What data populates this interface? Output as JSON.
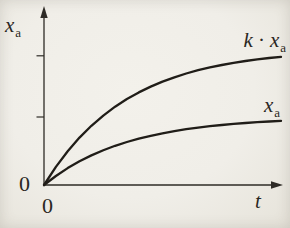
{
  "colors": {
    "background": "#f0eee8",
    "ink": "#201d18",
    "axis": "#2e2b26",
    "text": "#2a2722"
  },
  "labels": {
    "y_axis": {
      "base": "x",
      "sub": "a"
    },
    "x_axis": "t",
    "origin_y": "0",
    "origin_x": "0",
    "curve_upper": {
      "factor": "k",
      "dot": "·",
      "base": "x",
      "sub": "a"
    },
    "curve_lower": {
      "base": "x",
      "sub": "a"
    }
  },
  "chart_data": {
    "type": "line",
    "title": "",
    "xlabel": "t",
    "ylabel": "x_a",
    "x_range": [
      0,
      1
    ],
    "y_range": [
      0,
      2
    ],
    "grid": false,
    "legend_position": "labels-at-curve-ends",
    "x": [
      0,
      0.05,
      0.1,
      0.15,
      0.2,
      0.25,
      0.3,
      0.35,
      0.4,
      0.45,
      0.5,
      0.55,
      0.6,
      0.65,
      0.7,
      0.75,
      0.8,
      0.85,
      0.9,
      0.95,
      1
    ],
    "series": [
      {
        "name": "k·x_a",
        "values": [
          0,
          0.266,
          0.497,
          0.697,
          0.871,
          1.021,
          1.151,
          1.264,
          1.362,
          1.447,
          1.521,
          1.584,
          1.64,
          1.688,
          1.729,
          1.765,
          1.797,
          1.824,
          1.847,
          1.867,
          1.885
        ]
      },
      {
        "name": "x_a",
        "values": [
          0,
          0.133,
          0.249,
          0.349,
          0.435,
          0.511,
          0.576,
          0.632,
          0.681,
          0.724,
          0.76,
          0.792,
          0.82,
          0.844,
          0.865,
          0.883,
          0.898,
          0.912,
          0.924,
          0.934,
          0.943
        ]
      }
    ],
    "y_tick_values": [
      1.9,
      1.0
    ],
    "x_tick_labels": [
      "0"
    ],
    "origin_label": "0"
  }
}
